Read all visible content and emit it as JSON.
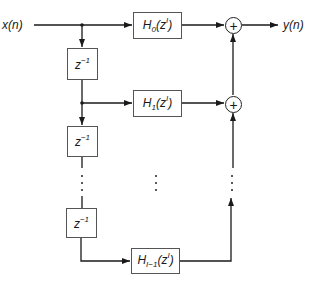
{
  "diagram": {
    "type": "polyphase filter bank block diagram",
    "input_label": "x(n)",
    "output_label": "y(n)",
    "delay_blocks": [
      {
        "label_base": "z",
        "label_exp": "−1"
      },
      {
        "label_base": "z",
        "label_exp": "−1"
      },
      {
        "label_base": "z",
        "label_exp": "−1"
      }
    ],
    "filter_blocks": [
      {
        "base": "H",
        "sub": "0",
        "arg_base": "(z",
        "arg_sup": "I",
        "arg_close": ")"
      },
      {
        "base": "H",
        "sub": "1",
        "arg_base": "(z",
        "arg_sup": "I",
        "arg_close": ")"
      },
      {
        "base": "H",
        "sub": "I−1",
        "arg_base": "(z",
        "arg_sup": "I",
        "arg_close": ")"
      }
    ],
    "adders": [
      {
        "symbol": "+"
      },
      {
        "symbol": "+"
      }
    ],
    "ellipsis": "⋮"
  }
}
